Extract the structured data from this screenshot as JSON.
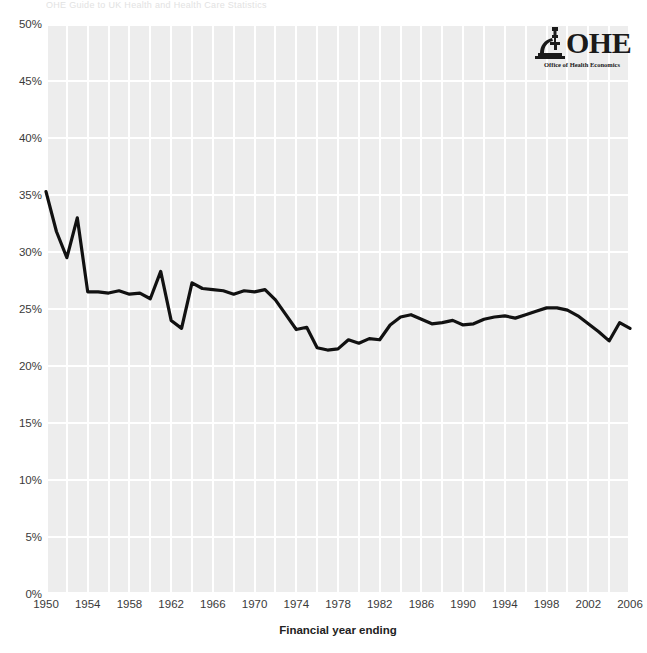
{
  "top_note": "OHE Guide to UK Health and Health Care Statistics",
  "logo": {
    "mark_name": "microscope-icon",
    "wordmark": "OHE",
    "subtitle": "Office of Health Economics"
  },
  "axes": {
    "x_title": "Financial year ending",
    "y_ticks": [
      "50%",
      "45%",
      "40%",
      "35%",
      "30%",
      "25%",
      "20%",
      "15%",
      "10%",
      "5%",
      "0%"
    ],
    "x_ticks": [
      "1950",
      "1954",
      "1958",
      "1962",
      "1966",
      "1970",
      "1974",
      "1978",
      "1982",
      "1986",
      "1990",
      "1994",
      "1998",
      "2002",
      "2006"
    ]
  },
  "colors": {
    "plot_background": "#ededed",
    "gridline": "#ffffff",
    "line": "#111111",
    "tick_text": "#3a3a3a"
  },
  "chart_data": {
    "type": "line",
    "title": "",
    "xlabel": "Financial year ending",
    "ylabel": "",
    "xlim": [
      1950,
      2006
    ],
    "ylim": [
      0,
      50
    ],
    "y_unit": "%",
    "grid": true,
    "legend": "none",
    "x": [
      1950,
      1951,
      1952,
      1953,
      1954,
      1955,
      1956,
      1957,
      1958,
      1959,
      1960,
      1961,
      1962,
      1963,
      1964,
      1965,
      1966,
      1967,
      1968,
      1969,
      1970,
      1971,
      1972,
      1973,
      1974,
      1975,
      1976,
      1977,
      1978,
      1979,
      1980,
      1981,
      1982,
      1983,
      1984,
      1985,
      1986,
      1987,
      1988,
      1989,
      1990,
      1991,
      1992,
      1993,
      1994,
      1995,
      1996,
      1997,
      1998,
      1999,
      2000,
      2001,
      2002,
      2003,
      2004,
      2005,
      2006
    ],
    "series": [
      {
        "name": "Share of total NHS expenditure",
        "values": [
          35.3,
          31.8,
          29.5,
          33.0,
          26.5,
          26.5,
          26.4,
          26.6,
          26.3,
          26.4,
          25.9,
          28.3,
          24.0,
          23.3,
          27.3,
          26.8,
          26.7,
          26.6,
          26.3,
          26.6,
          26.5,
          26.7,
          25.8,
          24.5,
          23.2,
          23.4,
          21.6,
          21.4,
          21.5,
          22.3,
          22.0,
          22.4,
          22.3,
          23.6,
          24.3,
          24.5,
          24.1,
          23.7,
          23.8,
          24.0,
          23.6,
          23.7,
          24.1,
          24.3,
          24.4,
          24.2,
          24.5,
          24.8,
          25.1,
          25.1,
          24.9,
          24.4,
          23.7,
          23.0,
          22.2,
          23.8,
          23.3
        ]
      }
    ]
  }
}
